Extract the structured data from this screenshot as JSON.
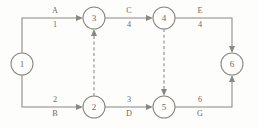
{
  "diagram": {
    "type": "activity-on-arrow-network",
    "nodes": [
      {
        "id": "n1",
        "label": "1",
        "cx": 22,
        "cy": 64,
        "r": 11
      },
      {
        "id": "n2",
        "label": "2",
        "cx": 94,
        "cy": 107,
        "r": 11
      },
      {
        "id": "n3",
        "label": "3",
        "cx": 94,
        "cy": 18,
        "r": 11
      },
      {
        "id": "n4",
        "label": "4",
        "cx": 164,
        "cy": 18,
        "r": 11
      },
      {
        "id": "n5",
        "label": "5",
        "cx": 164,
        "cy": 107,
        "r": 11
      },
      {
        "id": "n6",
        "label": "6",
        "cx": 232,
        "cy": 64,
        "r": 11
      }
    ],
    "edges": [
      {
        "id": "e-a",
        "from": "1",
        "to": "3",
        "style": "solid",
        "activity": "A",
        "duration": "1",
        "label_order": "letter-above-number-below",
        "label_x": 55,
        "label_top_y": 11,
        "label_bottom_y": 25
      },
      {
        "id": "e-c",
        "from": "3",
        "to": "4",
        "style": "solid",
        "activity": "C",
        "duration": "4",
        "label_order": "letter-above-number-below",
        "label_x": 129,
        "label_top_y": 11,
        "label_bottom_y": 25
      },
      {
        "id": "e-e",
        "from": "4",
        "to": "6",
        "style": "solid",
        "activity": "E",
        "duration": "4",
        "label_order": "letter-above-number-below",
        "label_x": 200,
        "label_top_y": 11,
        "label_bottom_y": 25
      },
      {
        "id": "e-b",
        "from": "1",
        "to": "2",
        "style": "solid",
        "activity": "B",
        "duration": "2",
        "label_order": "number-above-letter-below",
        "label_x": 55,
        "label_top_y": 100,
        "label_bottom_y": 114
      },
      {
        "id": "e-d",
        "from": "2",
        "to": "5",
        "style": "solid",
        "activity": "D",
        "duration": "3",
        "label_order": "number-above-letter-below",
        "label_x": 129,
        "label_top_y": 100,
        "label_bottom_y": 114
      },
      {
        "id": "e-g",
        "from": "5",
        "to": "6",
        "style": "solid",
        "activity": "G",
        "duration": "6",
        "label_order": "number-above-letter-below",
        "label_x": 200,
        "label_top_y": 100,
        "label_bottom_y": 114
      },
      {
        "id": "e-dummy-2-3",
        "from": "2",
        "to": "3",
        "style": "dashed",
        "activity": "",
        "duration": "",
        "direction": "up"
      },
      {
        "id": "e-dummy-4-5",
        "from": "4",
        "to": "5",
        "style": "dashed",
        "activity": "",
        "duration": "",
        "direction": "down"
      }
    ],
    "colors": {
      "line": "#8a8780",
      "text": "#6e6b65",
      "background": "#fdfdfc",
      "node_fill": "#fdfdfc"
    }
  }
}
